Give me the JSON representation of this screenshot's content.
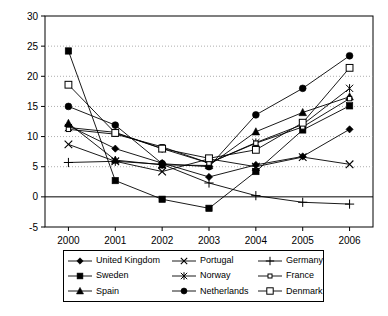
{
  "chart_data": {
    "type": "line",
    "title": "",
    "xlabel": "",
    "ylabel": "",
    "categories": [
      "2000",
      "2001",
      "2002",
      "2003",
      "2004",
      "2005",
      "2006"
    ],
    "x": [
      2000,
      2001,
      2002,
      2003,
      2004,
      2005,
      2006
    ],
    "ylim": [
      -5,
      30
    ],
    "yticks": [
      -5,
      0,
      5,
      10,
      15,
      20,
      25,
      30
    ],
    "ytick_labels": [
      "-5",
      "0",
      "5",
      "10",
      "15",
      "20",
      "25",
      "30"
    ],
    "grid": "horizontal-dotted",
    "legend_position": "bottom",
    "series": [
      {
        "name": "United Kingdom",
        "marker": "filled-diamond",
        "values": [
          11.8,
          8.0,
          5.6,
          3.3,
          5.3,
          6.7,
          11.2
        ]
      },
      {
        "name": "Sweden",
        "marker": "filled-square",
        "values": [
          24.2,
          2.7,
          -0.4,
          -1.9,
          4.2,
          11.1,
          15.1
        ]
      },
      {
        "name": "Spain",
        "marker": "filled-triangle",
        "values": [
          12.2,
          6.1,
          5.3,
          5.2,
          10.8,
          14.0,
          16.6
        ]
      },
      {
        "name": "Portugal",
        "marker": "x-cross",
        "values": [
          8.7,
          5.9,
          4.2,
          6.3,
          5.0,
          6.6,
          5.4
        ]
      },
      {
        "name": "Norway",
        "marker": "asterisk",
        "values": [
          11.5,
          10.7,
          8.0,
          5.6,
          9.0,
          12.0,
          18.0
        ]
      },
      {
        "name": "Netherlands",
        "marker": "filled-circle",
        "values": [
          15.0,
          11.9,
          5.5,
          5.0,
          13.6,
          18.0,
          23.4
        ]
      },
      {
        "name": "Germany",
        "marker": "plus",
        "values": [
          5.7,
          5.9,
          5.4,
          2.3,
          0.2,
          -0.9,
          -1.2
        ]
      },
      {
        "name": "France",
        "marker": "open-small-square",
        "values": [
          11.2,
          10.4,
          8.3,
          5.6,
          8.9,
          11.6,
          16.3
        ]
      },
      {
        "name": "Denmark",
        "marker": "open-square",
        "values": [
          18.6,
          10.6,
          8.0,
          6.4,
          7.8,
          12.3,
          21.4
        ]
      }
    ]
  },
  "legend": {
    "items": [
      {
        "label": "United Kingdom",
        "marker": "filled-diamond"
      },
      {
        "label": "Portugal",
        "marker": "x-cross"
      },
      {
        "label": "Germany",
        "marker": "plus"
      },
      {
        "label": "Sweden",
        "marker": "filled-square"
      },
      {
        "label": "Norway",
        "marker": "asterisk"
      },
      {
        "label": "France",
        "marker": "open-small-square"
      },
      {
        "label": "Spain",
        "marker": "filled-triangle"
      },
      {
        "label": "Netherlands",
        "marker": "filled-circle"
      },
      {
        "label": "Denmark",
        "marker": "open-square"
      }
    ]
  },
  "colors": {
    "line": "#000000",
    "axis": "#000000",
    "grid": "#999999",
    "background": "#ffffff"
  }
}
